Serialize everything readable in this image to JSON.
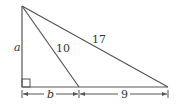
{
  "diagram": {
    "type": "right-triangle-geometry",
    "colors": {
      "stroke": "#555555",
      "text": "#333333",
      "background": "#ffffff"
    },
    "points": {
      "apex": {
        "x": 22,
        "y": 6
      },
      "right_angle": {
        "x": 22,
        "y": 87
      },
      "middle": {
        "x": 79,
        "y": 87
      },
      "right": {
        "x": 168,
        "y": 87
      }
    },
    "labels": {
      "vertical_side": "a",
      "inner_segment": "10",
      "hypotenuse": "17",
      "left_base": "b",
      "right_base": "9"
    },
    "right_angle_marker": true
  }
}
